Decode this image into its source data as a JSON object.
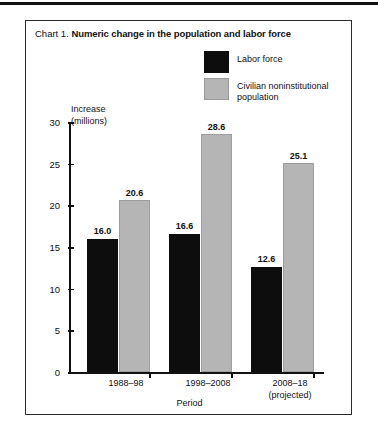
{
  "page": {
    "top_rule": true
  },
  "chart": {
    "number_label": "Chart 1.",
    "title": "Numeric change in the population and labor force",
    "y_axis_title_line1": "Increase",
    "y_axis_title_line2": "(millions)",
    "x_axis_title": "Period",
    "legend": [
      {
        "label": "Labor force",
        "color": "#0d0d0d",
        "swatch": "black-swatch"
      },
      {
        "label": "Civilian noninstitutional population",
        "color": "#b5b5b5",
        "swatch": "gray-swatch"
      }
    ]
  },
  "chart_data": {
    "type": "bar",
    "title": "Chart 1. Numeric change in the population and labor force",
    "xlabel": "Period",
    "ylabel": "Increase (millions)",
    "ylim": [
      0,
      30
    ],
    "yticks": [
      0,
      5,
      10,
      15,
      20,
      25,
      30
    ],
    "grid": false,
    "legend_position": "top-right",
    "categories": [
      "1988–98",
      "1998–2008",
      "2008–18 (projected)"
    ],
    "category_lines": [
      [
        "1988–98"
      ],
      [
        "1998–2008"
      ],
      [
        "2008–18",
        "(projected)"
      ]
    ],
    "series": [
      {
        "name": "Labor force",
        "color": "#0d0d0d",
        "values": [
          16.0,
          16.6,
          12.6
        ],
        "labels": [
          "16.0",
          "16.6",
          "12.6"
        ]
      },
      {
        "name": "Civilian noninstitutional population",
        "color": "#b5b5b5",
        "values": [
          20.6,
          28.6,
          25.1
        ],
        "labels": [
          "20.6",
          "28.6",
          "25.1"
        ]
      }
    ]
  }
}
